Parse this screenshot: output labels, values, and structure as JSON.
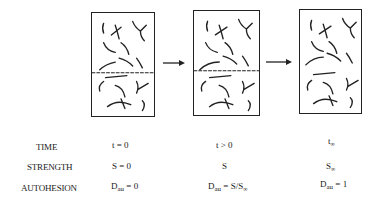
{
  "diagram": {
    "stages": [
      {
        "id": "initial",
        "has_interface": true
      },
      {
        "id": "intermediate",
        "has_interface": true
      },
      {
        "id": "final",
        "has_interface": false
      }
    ],
    "arrows": [
      "arrow-1",
      "arrow-2"
    ]
  },
  "rows": [
    {
      "label": "TIME",
      "values": [
        {
          "main": "t = 0",
          "sub": "",
          "rest": ""
        },
        {
          "main": "t > 0",
          "sub": "",
          "rest": ""
        },
        {
          "main": "t",
          "sub": "∞",
          "rest": ""
        }
      ]
    },
    {
      "label": "STRENGTH",
      "values": [
        {
          "main": "S = 0",
          "sub": "",
          "rest": ""
        },
        {
          "main": "S",
          "sub": "",
          "rest": ""
        },
        {
          "main": "S",
          "sub": "∞",
          "rest": ""
        }
      ]
    },
    {
      "label": "AUTOHESION",
      "values": [
        {
          "main": "D",
          "sub": "au",
          "rest": " = 0"
        },
        {
          "main": "D",
          "sub": "au",
          "rest": " = S/S",
          "rest_sub": "∞"
        },
        {
          "main": "D",
          "sub": "au",
          "rest": " = 1"
        }
      ]
    }
  ]
}
